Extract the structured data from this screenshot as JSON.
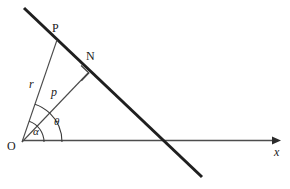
{
  "figure": {
    "type": "geometry-diagram",
    "background_color": "#ffffff",
    "stroke_color": "#1a1a1a",
    "thin_stroke_color": "#555555",
    "axis_color": "#4d4d4d"
  },
  "points": [
    {
      "id": "O",
      "label": "O",
      "label_x": 7,
      "label_y": 140,
      "x": 22,
      "y": 142
    },
    {
      "id": "P",
      "label": "P",
      "label_x": 52,
      "label_y": 22,
      "x": 57,
      "y": 40
    },
    {
      "id": "N",
      "label": "N",
      "label_x": 86,
      "label_y": 50,
      "x": 88,
      "y": 73
    }
  ],
  "segments": [
    {
      "id": "OP",
      "label": "r",
      "label_x": 29,
      "label_y": 78,
      "from": "O",
      "to": "P"
    },
    {
      "id": "ON",
      "label": "p",
      "label_x": 51,
      "label_y": 86,
      "from": "O",
      "to": "N"
    }
  ],
  "angles": [
    {
      "id": "alpha",
      "label": "α",
      "label_x": 33,
      "label_y": 126,
      "radius": 22,
      "between": "x-axis and OP"
    },
    {
      "id": "theta",
      "label": "θ",
      "label_x": 54,
      "label_y": 116,
      "radius": 40,
      "between": "x-axis and ON"
    }
  ],
  "axis": {
    "id": "x-axis",
    "label": "x",
    "label_x": 274,
    "label_y": 146,
    "start_x": 22,
    "end_x": 280,
    "y": 140,
    "arrow": "right-arrowhead"
  },
  "line": {
    "id": "oblique-line",
    "x1": 24,
    "y1": 8,
    "x2": 202,
    "y2": 177,
    "width": 3,
    "crosses_x_axis_at_x": 163
  },
  "right_angle": {
    "id": "right-angle-mark-at-N",
    "at_point": "N",
    "size": 11
  }
}
